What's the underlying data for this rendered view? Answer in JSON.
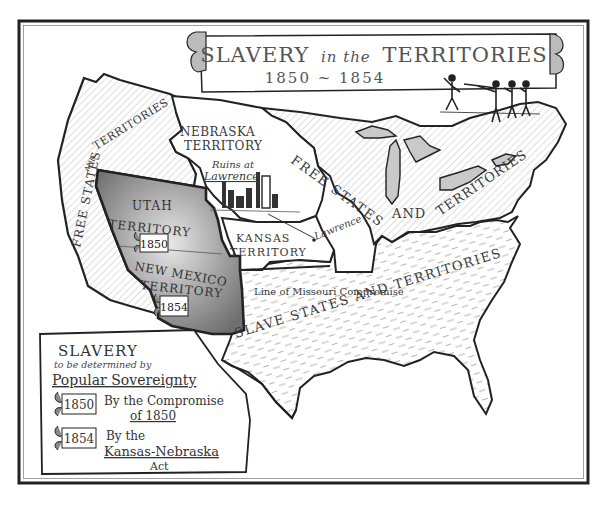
{
  "title": {
    "main_part1": "SLAVERY",
    "main_part2": "in the",
    "main_part3": "TERRITORIES",
    "years": "1850 ~ 1854"
  },
  "regions": {
    "free_west": {
      "label_a": "FREE STATES",
      "label_b": "AND",
      "label_c": "TERRITORIES"
    },
    "nebraska": {
      "line1": "NEBRASKA",
      "line2": "TERRITORY"
    },
    "ruins": {
      "line1": "Ruins at",
      "line2": "Lawrence"
    },
    "utah": {
      "line1": "UTAH",
      "line2": "TERRITORY",
      "year": "1850"
    },
    "new_mexico": {
      "line1": "NEW MEXICO",
      "line2": "TERRITORY",
      "year": "1854"
    },
    "kansas": {
      "line1": "KANSAS",
      "line2": "TERRITORY"
    },
    "lawrence": "Lawrence",
    "free_east": {
      "label_a": "FREE STATES",
      "label_b": "AND",
      "label_c": "TERRITORIES"
    },
    "missouri_line": "Line of Missouri Compromise",
    "slave": {
      "label": "SLAVE STATES AND TERRITORIES"
    }
  },
  "legend": {
    "heading": "SLAVERY",
    "subheading": "to be determined by",
    "heading2": "Popular Sovereignty",
    "items": [
      {
        "year": "1850",
        "line1": "By the Compromise",
        "line2": "of 1850"
      },
      {
        "year": "1854",
        "line1": "By the",
        "line2": "Kansas-Nebraska",
        "line3": "Act"
      }
    ]
  },
  "colors": {
    "ink": "#2a2a2a",
    "territory_fill": "#8c8c8c",
    "territory_light": "#d8d8d8",
    "paper": "#ffffff",
    "hatch": "#9a9a9a"
  }
}
